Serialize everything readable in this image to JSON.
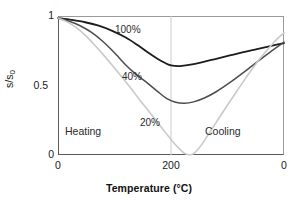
{
  "chart_data": {
    "type": "line",
    "title": "",
    "xlabel": "Temperature (°C)",
    "ylabel": "s/s0",
    "ylabel_main": "s/s",
    "ylabel_sub": "0",
    "xlim": [
      0,
      400
    ],
    "ylim": [
      0,
      1
    ],
    "grid": false,
    "legend": "inline-annotations",
    "x_axis_note": "Temperature ramps 0 °C up to 200 °C (heating) then back down to 0 °C (cooling); plotted left to right along the path.",
    "xticks": [
      {
        "label": "0",
        "path_position": 0
      },
      {
        "label": "200",
        "path_position": 0.5
      },
      {
        "label": "0",
        "path_position": 1
      }
    ],
    "yticks": [
      {
        "label": "1",
        "value": 1
      },
      {
        "label": "0.5",
        "value": 0.5
      },
      {
        "label": "0",
        "value": 0
      }
    ],
    "vertical_marker": {
      "label": "200",
      "path_position": 0.5,
      "color": "#cccccc"
    },
    "annotations": [
      {
        "text": "100%",
        "path_position": 0.27,
        "value": 0.9
      },
      {
        "text": "40%",
        "path_position": 0.29,
        "value": 0.57
      },
      {
        "text": "20%",
        "path_position": 0.38,
        "value": 0.24
      },
      {
        "text": "Heating",
        "path_position": 0.06,
        "value": 0.18
      },
      {
        "text": "Cooling",
        "path_position": 0.66,
        "value": 0.18
      }
    ],
    "series": [
      {
        "name": "100%",
        "color": "#1c1c1c",
        "width": 1.8,
        "points": [
          {
            "t": 0.0,
            "v": 0.985
          },
          {
            "t": 0.06,
            "v": 0.972
          },
          {
            "t": 0.12,
            "v": 0.955
          },
          {
            "t": 0.18,
            "v": 0.93
          },
          {
            "t": 0.24,
            "v": 0.893
          },
          {
            "t": 0.3,
            "v": 0.845
          },
          {
            "t": 0.35,
            "v": 0.793
          },
          {
            "t": 0.4,
            "v": 0.735
          },
          {
            "t": 0.44,
            "v": 0.692
          },
          {
            "t": 0.47,
            "v": 0.665
          },
          {
            "t": 0.5,
            "v": 0.645
          },
          {
            "t": 0.54,
            "v": 0.64
          },
          {
            "t": 0.58,
            "v": 0.648
          },
          {
            "t": 0.64,
            "v": 0.668
          },
          {
            "t": 0.7,
            "v": 0.692
          },
          {
            "t": 0.76,
            "v": 0.716
          },
          {
            "t": 0.82,
            "v": 0.74
          },
          {
            "t": 0.88,
            "v": 0.762
          },
          {
            "t": 0.94,
            "v": 0.784
          },
          {
            "t": 1.0,
            "v": 0.805
          }
        ]
      },
      {
        "name": "40%",
        "color": "#4d4d4d",
        "width": 1.5,
        "points": [
          {
            "t": 0.0,
            "v": 0.985
          },
          {
            "t": 0.05,
            "v": 0.962
          },
          {
            "t": 0.1,
            "v": 0.928
          },
          {
            "t": 0.15,
            "v": 0.88
          },
          {
            "t": 0.2,
            "v": 0.815
          },
          {
            "t": 0.24,
            "v": 0.752
          },
          {
            "t": 0.27,
            "v": 0.7
          },
          {
            "t": 0.3,
            "v": 0.648
          },
          {
            "t": 0.33,
            "v": 0.602
          },
          {
            "t": 0.36,
            "v": 0.562
          },
          {
            "t": 0.4,
            "v": 0.512
          },
          {
            "t": 0.44,
            "v": 0.458
          },
          {
            "t": 0.48,
            "v": 0.408
          },
          {
            "t": 0.52,
            "v": 0.38
          },
          {
            "t": 0.56,
            "v": 0.372
          },
          {
            "t": 0.6,
            "v": 0.382
          },
          {
            "t": 0.65,
            "v": 0.412
          },
          {
            "t": 0.7,
            "v": 0.455
          },
          {
            "t": 0.76,
            "v": 0.52
          },
          {
            "t": 0.82,
            "v": 0.592
          },
          {
            "t": 0.88,
            "v": 0.668
          },
          {
            "t": 0.94,
            "v": 0.742
          },
          {
            "t": 1.0,
            "v": 0.812
          }
        ]
      },
      {
        "name": "20%",
        "color": "#c9c9c9",
        "width": 1.6,
        "points": [
          {
            "t": 0.0,
            "v": 0.985
          },
          {
            "t": 0.04,
            "v": 0.958
          },
          {
            "t": 0.08,
            "v": 0.918
          },
          {
            "t": 0.12,
            "v": 0.862
          },
          {
            "t": 0.16,
            "v": 0.795
          },
          {
            "t": 0.2,
            "v": 0.722
          },
          {
            "t": 0.24,
            "v": 0.645
          },
          {
            "t": 0.28,
            "v": 0.566
          },
          {
            "t": 0.32,
            "v": 0.485
          },
          {
            "t": 0.36,
            "v": 0.4
          },
          {
            "t": 0.4,
            "v": 0.318
          },
          {
            "t": 0.44,
            "v": 0.235
          },
          {
            "t": 0.48,
            "v": 0.152
          },
          {
            "t": 0.51,
            "v": 0.092
          },
          {
            "t": 0.54,
            "v": 0.04
          },
          {
            "t": 0.56,
            "v": 0.012
          },
          {
            "t": 0.58,
            "v": 0.002
          },
          {
            "t": 0.6,
            "v": 0.01
          },
          {
            "t": 0.63,
            "v": 0.062
          },
          {
            "t": 0.66,
            "v": 0.135
          },
          {
            "t": 0.7,
            "v": 0.235
          },
          {
            "t": 0.74,
            "v": 0.335
          },
          {
            "t": 0.78,
            "v": 0.432
          },
          {
            "t": 0.82,
            "v": 0.528
          },
          {
            "t": 0.86,
            "v": 0.62
          },
          {
            "t": 0.9,
            "v": 0.706
          },
          {
            "t": 0.94,
            "v": 0.783
          },
          {
            "t": 0.97,
            "v": 0.835
          },
          {
            "t": 1.0,
            "v": 0.878
          }
        ]
      }
    ]
  },
  "axes": {
    "ytick_1": "1",
    "ytick_05": "0.5",
    "ytick_0": "0",
    "xtick_left": "0",
    "xtick_mid": "200",
    "xtick_right": "0",
    "xlabel": "Temperature (°C)",
    "ylabel_main": "s/s",
    "ylabel_sub": "0"
  },
  "labels": {
    "series_100": "100%",
    "series_40": "40%",
    "series_20": "20%",
    "heating": "Heating",
    "cooling": "Cooling"
  },
  "colors": {
    "series_100": "#1c1c1c",
    "series_40": "#4d4d4d",
    "series_20": "#c9c9c9",
    "axis": "#5a5a5a",
    "gridline": "#cccccc",
    "background": "#ffffff"
  }
}
